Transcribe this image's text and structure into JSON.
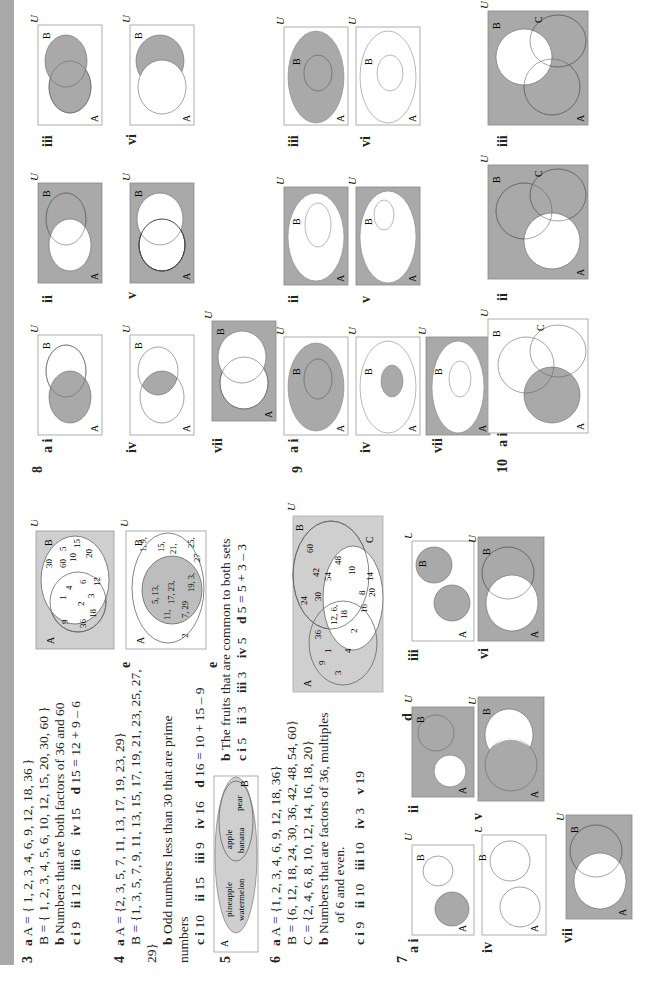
{
  "colors": {
    "shade": "#a9a9a9",
    "light_shade": "#cfcfcf",
    "outline": "#666666",
    "stripe": "#a8a8a8"
  },
  "q3": {
    "number": "3",
    "a_label": "a",
    "a_line1": "A = { 1, 2, 3, 4, 6, 9, 12, 18, 36 }",
    "a_line2": "B = { 1, 2, 3, 4, 5, 6, 10, 12, 15, 20, 30, 60 }",
    "b_label": "b",
    "b_text": "Numbers that are both factors of 36 and 60",
    "c_parts": [
      {
        "label": "c i",
        "value": "9"
      },
      {
        "label": "ii",
        "value": "12"
      },
      {
        "label": "iii",
        "value": "6"
      },
      {
        "label": "iv",
        "value": "15"
      },
      {
        "label": "d",
        "value": "15 = 12 + 9 – 6"
      }
    ],
    "e_label": "e",
    "venn_e": {
      "U": "U",
      "A": "A",
      "B": "B",
      "only_A": [
        "9",
        "36",
        "18"
      ],
      "both": [
        "1",
        "4",
        "2",
        "6",
        "3",
        "12"
      ],
      "only_B": [
        "30",
        "60",
        "5",
        "10",
        "15",
        "20"
      ]
    }
  },
  "q4": {
    "number": "4",
    "a_label": "a",
    "a_line1": "A = {2, 3, 5, 7, 11, 13, 17, 19, 23, 29}",
    "a_line2": "B = {1, 3, 5, 7, 9, 11, 13, 15, 17, 19, 21, 23, 25, 27,",
    "a_line3": "29}",
    "b_label": "b",
    "b_text": "Odd numbers less than 30 that are prime",
    "b_text2": "numbers",
    "c_parts": [
      {
        "label": "c i",
        "value": "10"
      },
      {
        "label": "ii",
        "value": "15"
      },
      {
        "label": "iii",
        "value": "9"
      },
      {
        "label": "iv",
        "value": "16"
      },
      {
        "label": "d",
        "value": "16 = 10 + 15 – 9"
      }
    ],
    "e_label": "e",
    "venn_e": {
      "U": "U",
      "A": "A",
      "B": "B",
      "only_A": [
        "2"
      ],
      "both_lines": [
        "5, 13,",
        "11,",
        "17, 23,",
        "7, 29",
        "19, 3,"
      ],
      "only_B_lines": [
        "1, 9,",
        "15,",
        "21,",
        "27",
        "25,"
      ]
    }
  },
  "q5": {
    "number": "5",
    "a_label": "a",
    "venn": {
      "A": "A",
      "B": "B",
      "A_items": [
        "pineapple",
        "watermelon"
      ],
      "B_items": [
        "apple",
        "banana",
        "pear"
      ]
    },
    "b_label": "b",
    "b_text": "The fruits that are common to both sets",
    "c_parts": [
      {
        "label": "c i",
        "value": "5"
      },
      {
        "label": "ii",
        "value": "3"
      },
      {
        "label": "iii",
        "value": "3"
      },
      {
        "label": "iv",
        "value": "5"
      },
      {
        "label": "d",
        "value": "5 = 5 + 3 – 3"
      }
    ]
  },
  "q6": {
    "number": "6",
    "a_label": "a",
    "a_line1": "A = {1, 2, 3, 4, 6, 9, 12, 18, 36}",
    "a_line2": "B = {6, 12, 18, 24, 30, 36, 42, 48, 54, 60}",
    "a_line3": "C = {2, 4, 6, 8, 10, 12, 14, 16, 18, 20}",
    "b_label": "b",
    "b_text": "Numbers that are factors of 36, multiples",
    "b_text2": "of 6 and even.",
    "c_parts": [
      {
        "label": "c i",
        "value": "9"
      },
      {
        "label": "ii",
        "value": "10"
      },
      {
        "label": "iii",
        "value": "10"
      },
      {
        "label": "iv",
        "value": "3"
      },
      {
        "label": "v",
        "value": "19"
      }
    ],
    "d_label": "d",
    "venn_d": {
      "U": "U",
      "A": "A",
      "B": "B",
      "C": "C",
      "only_A": [
        "9",
        "1",
        "3"
      ],
      "A_B": [
        "36"
      ],
      "A_B_C": [
        "12, 6,",
        "18"
      ],
      "A_C": [
        "4",
        "2"
      ],
      "only_B": [
        "24",
        "30",
        "42",
        "60",
        "54",
        "48"
      ],
      "only_C": [
        "16",
        "8",
        "20",
        "10",
        "14"
      ]
    }
  },
  "q7": {
    "number": "7",
    "labels": [
      "a i",
      "ii",
      "iii",
      "iv",
      "v",
      "vi",
      "vii"
    ],
    "U": "U",
    "A": "A",
    "B": "B"
  },
  "q8": {
    "number": "8",
    "labels": [
      "a i",
      "ii",
      "iii",
      "iv",
      "v",
      "vi",
      "vii"
    ],
    "U": "U",
    "A": "A",
    "B": "B"
  },
  "q9": {
    "number": "9",
    "labels": [
      "a i",
      "ii",
      "iii",
      "iv",
      "v",
      "vi",
      "vii"
    ],
    "U": "U",
    "A": "A",
    "B": "B"
  },
  "q10": {
    "number": "10",
    "labels": [
      "a i",
      "ii",
      "iii"
    ],
    "U": "U",
    "A": "A",
    "B": "B",
    "C": "C"
  }
}
